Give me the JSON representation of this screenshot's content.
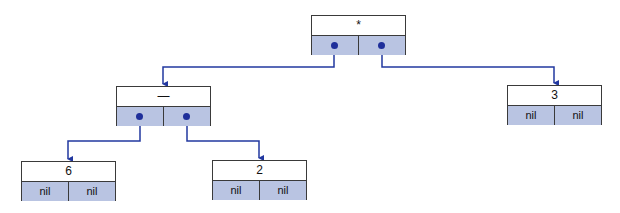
{
  "diagram": {
    "type": "binary-expression-tree",
    "colors": {
      "link": "#2238a0",
      "pointer_cell": "#b9c4e2",
      "border": "#3a3a3a"
    },
    "nodes": [
      {
        "id": "root",
        "value": "*",
        "left": "pointer",
        "right": "pointer",
        "x": 311,
        "y": 15
      },
      {
        "id": "minus",
        "value": "—",
        "left": "pointer",
        "right": "pointer",
        "x": 116,
        "y": 86
      },
      {
        "id": "three",
        "value": "3",
        "left": "nil",
        "right": "nil",
        "x": 507,
        "y": 85
      },
      {
        "id": "six",
        "value": "6",
        "left": "nil",
        "right": "nil",
        "x": 21,
        "y": 161
      },
      {
        "id": "two",
        "value": "2",
        "left": "nil",
        "right": "nil",
        "x": 212,
        "y": 160
      }
    ],
    "edges": [
      {
        "from": "root",
        "side": "left",
        "to": "minus"
      },
      {
        "from": "root",
        "side": "right",
        "to": "three"
      },
      {
        "from": "minus",
        "side": "left",
        "to": "six"
      },
      {
        "from": "minus",
        "side": "right",
        "to": "two"
      }
    ],
    "nil_label": "nil"
  }
}
